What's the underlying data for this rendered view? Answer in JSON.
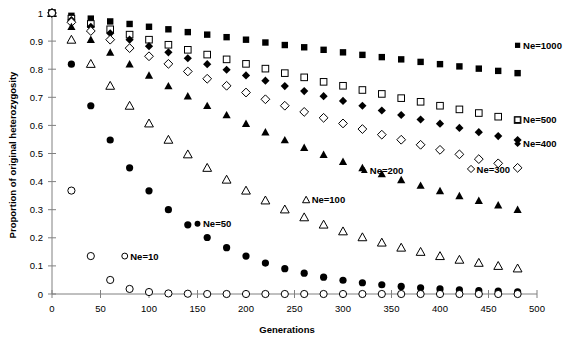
{
  "chart_data": {
    "type": "scatter",
    "title": "",
    "subtitle": "",
    "xlabel": "Generations",
    "ylabel": "Proportion of original heterozygosity",
    "xlim": [
      0,
      500
    ],
    "ylim": [
      0,
      1
    ],
    "xticks": [
      0,
      50,
      100,
      150,
      200,
      250,
      300,
      350,
      400,
      450,
      500
    ],
    "xtick_labels": [
      "0",
      "50",
      "100",
      "150",
      "200",
      "250",
      "300",
      "350",
      "400",
      "450",
      "500"
    ],
    "yticks": [
      0,
      0.1,
      0.2,
      0.3,
      0.4,
      0.5,
      0.6,
      0.7,
      0.8,
      0.9,
      1
    ],
    "ytick_labels": [
      "0",
      "0.1",
      "0.2",
      "0.3",
      "0.4",
      "0.5",
      "0.6",
      "0.7",
      "0.8",
      "0.9",
      "1"
    ],
    "grid": false,
    "legend_position": "inline-annotations",
    "x": [
      0,
      20,
      40,
      60,
      80,
      100,
      120,
      140,
      160,
      180,
      200,
      220,
      240,
      260,
      280,
      300,
      320,
      340,
      360,
      380,
      400,
      420,
      440,
      460,
      480
    ],
    "series": [
      {
        "name": "Ne=1000",
        "label": "Ne=1000",
        "marker": "filled-square",
        "color": "#000000",
        "label_x": 480,
        "label_y": 0.885,
        "values": [
          1,
          0.99,
          0.98,
          0.97,
          0.961,
          0.951,
          0.942,
          0.932,
          0.923,
          0.914,
          0.905,
          0.895,
          0.886,
          0.878,
          0.869,
          0.86,
          0.851,
          0.843,
          0.835,
          0.826,
          0.818,
          0.81,
          0.802,
          0.794,
          0.786
        ]
      },
      {
        "name": "Ne=500",
        "label": "Ne=500",
        "marker": "open-square",
        "color": "#000000",
        "label_x": 480,
        "label_y": 0.62,
        "values": [
          1,
          0.98,
          0.961,
          0.942,
          0.923,
          0.905,
          0.887,
          0.869,
          0.852,
          0.835,
          0.819,
          0.802,
          0.786,
          0.771,
          0.755,
          0.741,
          0.726,
          0.712,
          0.697,
          0.684,
          0.67,
          0.657,
          0.644,
          0.631,
          0.619
        ]
      },
      {
        "name": "Ne=400",
        "label": "Ne=400",
        "marker": "filled-diamond",
        "color": "#000000",
        "label_x": 480,
        "label_y": 0.535,
        "values": [
          1,
          0.975,
          0.951,
          0.928,
          0.905,
          0.882,
          0.86,
          0.839,
          0.818,
          0.798,
          0.778,
          0.759,
          0.74,
          0.722,
          0.704,
          0.687,
          0.67,
          0.653,
          0.637,
          0.621,
          0.606,
          0.591,
          0.576,
          0.562,
          0.548
        ]
      },
      {
        "name": "Ne=300",
        "label": "Ne=300",
        "marker": "open-diamond",
        "color": "#000000",
        "label_x": 432,
        "label_y": 0.445,
        "values": [
          1,
          0.967,
          0.936,
          0.905,
          0.875,
          0.846,
          0.819,
          0.792,
          0.766,
          0.741,
          0.717,
          0.693,
          0.67,
          0.648,
          0.627,
          0.607,
          0.587,
          0.567,
          0.549,
          0.531,
          0.513,
          0.497,
          0.48,
          0.465,
          0.449
        ]
      },
      {
        "name": "Ne=200",
        "label": "Ne=200",
        "marker": "filled-triangle",
        "color": "#000000",
        "label_x": 322,
        "label_y": 0.44,
        "values": [
          1,
          0.951,
          0.905,
          0.86,
          0.818,
          0.778,
          0.74,
          0.704,
          0.67,
          0.637,
          0.606,
          0.576,
          0.548,
          0.521,
          0.496,
          0.471,
          0.449,
          0.427,
          0.406,
          0.386,
          0.367,
          0.349,
          0.332,
          0.316,
          0.3
        ]
      },
      {
        "name": "Ne=100",
        "label": "Ne=100",
        "marker": "open-triangle",
        "color": "#000000",
        "label_x": 262,
        "label_y": 0.335,
        "values": [
          1,
          0.905,
          0.819,
          0.741,
          0.67,
          0.607,
          0.549,
          0.497,
          0.449,
          0.407,
          0.368,
          0.333,
          0.301,
          0.273,
          0.247,
          0.223,
          0.202,
          0.183,
          0.165,
          0.15,
          0.135,
          0.122,
          0.111,
          0.1,
          0.091
        ]
      },
      {
        "name": "Ne=50",
        "label": "Ne=50",
        "marker": "filled-circle",
        "color": "#000000",
        "label_x": 150,
        "label_y": 0.25,
        "values": [
          1,
          0.818,
          0.67,
          0.548,
          0.449,
          0.367,
          0.3,
          0.246,
          0.201,
          0.165,
          0.135,
          0.11,
          0.09,
          0.074,
          0.06,
          0.049,
          0.04,
          0.033,
          0.027,
          0.022,
          0.018,
          0.015,
          0.012,
          0.01,
          0.008
        ]
      },
      {
        "name": "Ne=10",
        "label": "Ne=10",
        "marker": "open-circle",
        "color": "#000000",
        "label_x": 75,
        "label_y": 0.135,
        "values": [
          1,
          0.368,
          0.135,
          0.05,
          0.018,
          0.007,
          0.002,
          0.001,
          0,
          0,
          0,
          0,
          0,
          0,
          0,
          0,
          0,
          0,
          0,
          0,
          0,
          0,
          0,
          0,
          0
        ]
      }
    ]
  },
  "axes": {
    "x_axis_name": "generations-axis",
    "y_axis_name": "heterozygosity-axis"
  }
}
